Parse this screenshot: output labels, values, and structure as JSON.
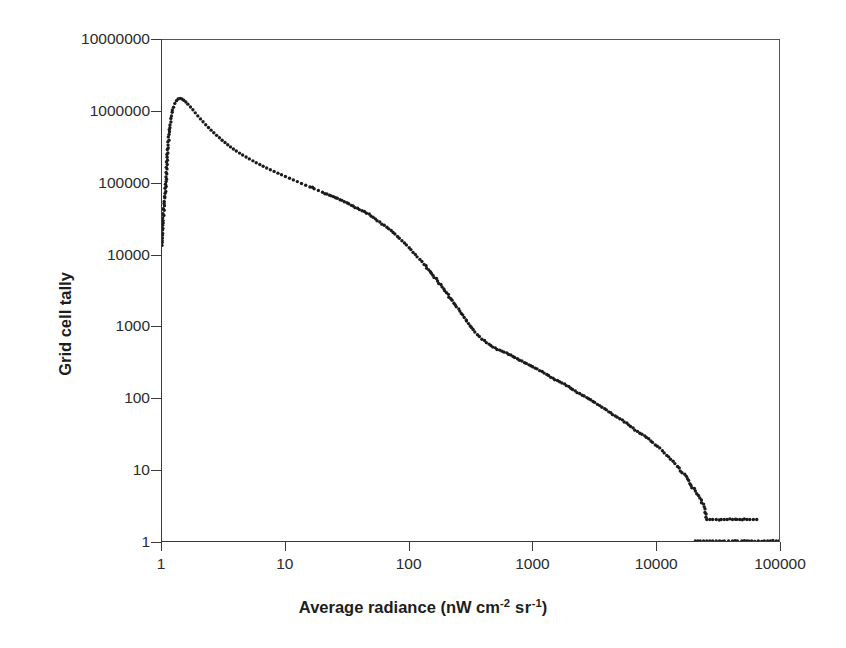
{
  "chart_data": {
    "type": "scatter",
    "title": "",
    "xlabel": "Average radiance (nW cm-2 sr-1)",
    "xlabel_parts": {
      "lead": "Average radiance (nW cm",
      "sup1": "-2",
      "mid": " sr",
      "sup2": "-1",
      "tail": ")"
    },
    "ylabel": "Grid cell tally",
    "xscale": "log",
    "yscale": "log",
    "xlim": [
      1,
      100000
    ],
    "ylim": [
      1,
      10000000
    ],
    "xticks": [
      1,
      10,
      100,
      1000,
      10000,
      100000
    ],
    "xtick_labels": [
      "1",
      "10",
      "100",
      "1000",
      "10000",
      "100000"
    ],
    "yticks": [
      1,
      10,
      100,
      1000,
      10000,
      100000,
      1000000,
      10000000
    ],
    "ytick_labels": [
      "1",
      "10",
      "100",
      "1000",
      "10000",
      "100000",
      "1000000",
      "10000000"
    ],
    "grid": false,
    "legend": null,
    "marker": "filled-circle",
    "marker_color": "#1b1b1b",
    "marker_size_px": 3.4,
    "series": [
      {
        "name": "Grid cell tally vs average radiance",
        "color": "#1b1b1b",
        "points": [
          [
            1.0,
            13500
          ],
          [
            1.02,
            30000
          ],
          [
            1.04,
            52000
          ],
          [
            1.06,
            72000
          ],
          [
            1.08,
            105000
          ],
          [
            1.1,
            230000
          ],
          [
            1.12,
            340000
          ],
          [
            1.14,
            480000
          ],
          [
            1.16,
            650000
          ],
          [
            1.18,
            800000
          ],
          [
            1.21,
            980000
          ],
          [
            1.24,
            1150000
          ],
          [
            1.27,
            1300000
          ],
          [
            1.31,
            1420000
          ],
          [
            1.35,
            1500000
          ],
          [
            1.4,
            1530000
          ],
          [
            1.45,
            1500000
          ],
          [
            1.5,
            1440000
          ],
          [
            1.56,
            1360000
          ],
          [
            1.62,
            1270000
          ],
          [
            1.7,
            1160000
          ],
          [
            1.78,
            1060000
          ],
          [
            1.86,
            960000
          ],
          [
            1.95,
            870000
          ],
          [
            2.05,
            790000
          ],
          [
            2.15,
            720000
          ],
          [
            2.26,
            655000
          ],
          [
            2.38,
            600000
          ],
          [
            2.5,
            550000
          ],
          [
            2.63,
            505000
          ],
          [
            2.77,
            465000
          ],
          [
            2.92,
            430000
          ],
          [
            3.07,
            398000
          ],
          [
            3.24,
            370000
          ],
          [
            3.41,
            344000
          ],
          [
            3.59,
            321000
          ],
          [
            3.79,
            300000
          ],
          [
            4.0,
            281000
          ],
          [
            4.25,
            263000
          ],
          [
            4.5,
            247000
          ],
          [
            4.8,
            232000
          ],
          [
            5.1,
            218000
          ],
          [
            5.45,
            205000
          ],
          [
            5.8,
            193000
          ],
          [
            6.2,
            182000
          ],
          [
            6.6,
            172000
          ],
          [
            7.05,
            163000
          ],
          [
            7.55,
            154000
          ],
          [
            8.1,
            146000
          ],
          [
            8.7,
            138000
          ],
          [
            9.3,
            131000
          ],
          [
            10.0,
            124000
          ],
          [
            10.8,
            117000
          ],
          [
            11.6,
            111000
          ],
          [
            12.5,
            105000
          ],
          [
            13.5,
            99000
          ],
          [
            14.6,
            93500
          ],
          [
            15.8,
            88500
          ],
          [
            17.1,
            83500
          ],
          [
            18.5,
            79000
          ],
          [
            20.0,
            74500
          ],
          [
            21.7,
            70500
          ],
          [
            23.5,
            66500
          ],
          [
            25.5,
            62500
          ],
          [
            27.7,
            58500
          ],
          [
            30.0,
            55000
          ],
          [
            32.6,
            51500
          ],
          [
            35.4,
            48000
          ],
          [
            38.5,
            44500
          ],
          [
            41.8,
            41200
          ],
          [
            45.4,
            38000
          ],
          [
            49.3,
            34800
          ],
          [
            53.6,
            31700
          ],
          [
            58.2,
            28700
          ],
          [
            63.2,
            25800
          ],
          [
            68.7,
            23000
          ],
          [
            74.6,
            20400
          ],
          [
            81.0,
            18000
          ],
          [
            88.0,
            15700
          ],
          [
            95.6,
            13700
          ],
          [
            104,
            11800
          ],
          [
            113,
            10100
          ],
          [
            123,
            8600
          ],
          [
            133,
            7300
          ],
          [
            145,
            6150
          ],
          [
            157,
            5150
          ],
          [
            171,
            4300
          ],
          [
            186,
            3550
          ],
          [
            202,
            2950
          ],
          [
            219,
            2430
          ],
          [
            238,
            1990
          ],
          [
            259,
            1630
          ],
          [
            281,
            1330
          ],
          [
            305,
            1090
          ],
          [
            332,
            900
          ],
          [
            360,
            760
          ],
          [
            391,
            660
          ],
          [
            425,
            590
          ],
          [
            462,
            540
          ],
          [
            502,
            500
          ],
          [
            545,
            465
          ],
          [
            592,
            435
          ],
          [
            643,
            405
          ],
          [
            699,
            378
          ],
          [
            759,
            352
          ],
          [
            825,
            327
          ],
          [
            896,
            303
          ],
          [
            974,
            281
          ],
          [
            1058,
            260
          ],
          [
            1150,
            240
          ],
          [
            1249,
            222
          ],
          [
            1357,
            205
          ],
          [
            1474,
            189
          ],
          [
            1602,
            175
          ],
          [
            1740,
            161
          ],
          [
            1891,
            148
          ],
          [
            2054,
            136
          ],
          [
            2232,
            125
          ],
          [
            2425,
            115
          ],
          [
            2635,
            106
          ],
          [
            2863,
            97
          ],
          [
            3111,
            89
          ],
          [
            3380,
            81
          ],
          [
            3673,
            74
          ],
          [
            3991,
            68
          ],
          [
            4336,
            62
          ],
          [
            4711,
            56
          ],
          [
            5119,
            51
          ],
          [
            5562,
            46
          ],
          [
            6043,
            42
          ],
          [
            6566,
            38
          ],
          [
            7134,
            34
          ],
          [
            7751,
            31
          ],
          [
            8422,
            28
          ],
          [
            9151,
            25
          ],
          [
            9943,
            22
          ],
          [
            10804,
            20
          ],
          [
            11739,
            17
          ],
          [
            12755,
            15
          ],
          [
            13859,
            13
          ],
          [
            15058,
            11
          ],
          [
            16361,
            9
          ],
          [
            17777,
            8
          ],
          [
            19316,
            6
          ],
          [
            20988,
            5
          ],
          [
            22805,
            4
          ],
          [
            24779,
            3
          ],
          [
            26000,
            2
          ],
          [
            27500,
            2
          ],
          [
            29000,
            2
          ],
          [
            31000,
            2
          ],
          [
            34000,
            2
          ],
          [
            36000,
            2
          ],
          [
            38000,
            2
          ],
          [
            42000,
            2
          ],
          [
            48000,
            2
          ],
          [
            55000,
            2
          ],
          [
            58000,
            2
          ],
          [
            62000,
            2
          ],
          [
            66000,
            2
          ],
          [
            21000,
            1
          ],
          [
            22000,
            1
          ],
          [
            23000,
            1
          ],
          [
            24500,
            1
          ],
          [
            26000,
            1
          ],
          [
            27500,
            1
          ],
          [
            29000,
            1
          ],
          [
            31000,
            1
          ],
          [
            33000,
            1
          ],
          [
            36000,
            1
          ],
          [
            39000,
            1
          ],
          [
            42000,
            1
          ],
          [
            46000,
            1
          ],
          [
            50000,
            1
          ],
          [
            55000,
            1
          ],
          [
            60000,
            1
          ],
          [
            68000,
            1
          ],
          [
            76000,
            1
          ],
          [
            85000,
            1
          ],
          [
            95000,
            1
          ],
          [
            100000,
            1
          ]
        ]
      }
    ]
  },
  "axes": {
    "plot_left_px": 161,
    "plot_top_px": 39,
    "plot_width_px": 619,
    "plot_height_px": 503
  }
}
